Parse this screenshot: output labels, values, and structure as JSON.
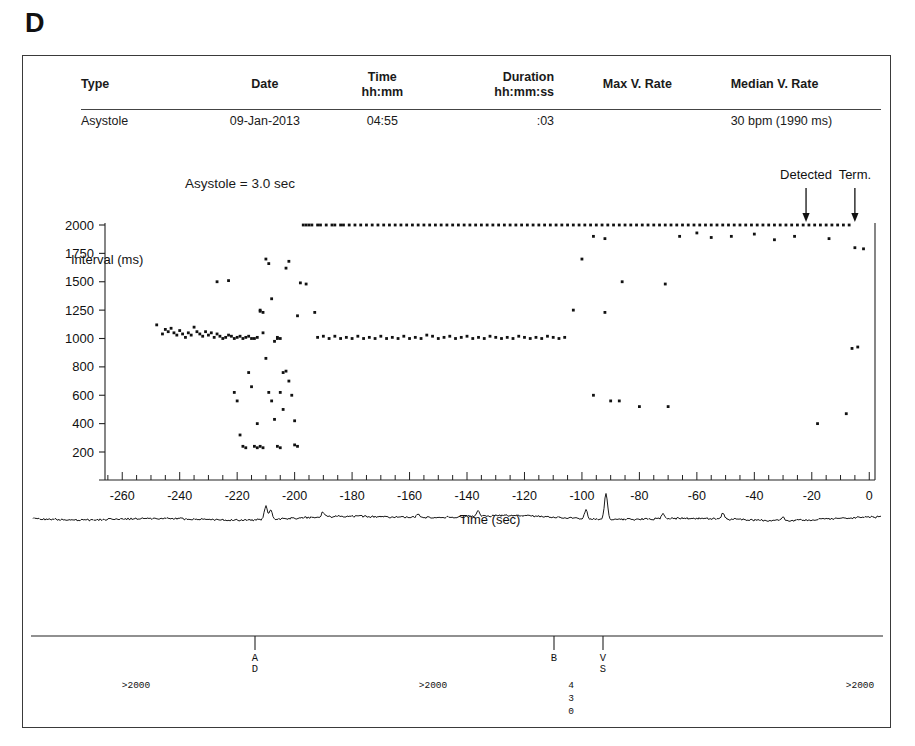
{
  "panel": {
    "letter": "D"
  },
  "summary": {
    "headers": [
      {
        "key": "type",
        "label": "Type"
      },
      {
        "key": "date",
        "label": "Date"
      },
      {
        "key": "time",
        "label": "Time\nhh:mm"
      },
      {
        "key": "dur",
        "label": "Duration\nhh:mm:ss"
      },
      {
        "key": "maxv",
        "label": "Max V. Rate"
      },
      {
        "key": "medv",
        "label": "Median V. Rate"
      }
    ],
    "row": {
      "type": "Asystole",
      "date": "09-Jan-2013",
      "time": "04:55",
      "dur": ":03",
      "maxv": "",
      "medv": "30 bpm (1990 ms)"
    }
  },
  "annotation": {
    "asystole_duration": "Asystole = 3.0 sec"
  },
  "chart_data": {
    "type": "scatter",
    "title": "",
    "xlabel": "Time (sec)",
    "ylabel": "Interval (ms)",
    "xlim": [
      -266,
      2
    ],
    "xticks": [
      -260,
      -240,
      -220,
      -200,
      -180,
      -160,
      -140,
      -120,
      -100,
      -80,
      -60,
      -40,
      -20,
      0
    ],
    "xtick_labels": [
      "-260",
      "-240",
      "-220",
      "-200",
      "-180",
      "-160",
      "-140",
      "-120",
      "-100",
      "-80",
      "-60",
      "-40",
      "-20",
      "0"
    ],
    "x_minor_tick_step": 5,
    "yticks": [
      2000,
      1750,
      1500,
      1250,
      1000,
      800,
      600,
      400,
      200
    ],
    "ytick_labels": [
      "2000",
      "1750",
      "1500",
      "1250",
      "1000",
      "800",
      "600",
      "400",
      "200"
    ],
    "y_scale": "nonlinear-even-spaced",
    "grid": false,
    "legend": false,
    "markers": [
      {
        "name": "Detected",
        "x": -22
      },
      {
        "name": "Term.",
        "x": -5
      }
    ],
    "points": [
      [
        -248,
        1120
      ],
      [
        -246,
        1040
      ],
      [
        -245,
        1080
      ],
      [
        -244,
        1060
      ],
      [
        -243,
        1090
      ],
      [
        -242,
        1050
      ],
      [
        -241,
        1030
      ],
      [
        -240,
        1070
      ],
      [
        -239,
        1040
      ],
      [
        -238,
        1010
      ],
      [
        -237,
        1050
      ],
      [
        -236,
        1030
      ],
      [
        -235,
        1100
      ],
      [
        -234,
        1060
      ],
      [
        -233,
        1040
      ],
      [
        -232,
        1020
      ],
      [
        -231,
        1060
      ],
      [
        -230,
        1030
      ],
      [
        -229,
        1050
      ],
      [
        -228,
        1010
      ],
      [
        -227,
        1040
      ],
      [
        -226,
        1020
      ],
      [
        -225,
        1000
      ],
      [
        -224,
        1010
      ],
      [
        -223,
        1030
      ],
      [
        -222,
        1020
      ],
      [
        -221,
        1000
      ],
      [
        -220,
        1010
      ],
      [
        -219,
        1020
      ],
      [
        -218,
        1000
      ],
      [
        -217,
        1010
      ],
      [
        -216,
        1020
      ],
      [
        -215,
        1000
      ],
      [
        -214,
        1000
      ],
      [
        -213,
        1010
      ],
      [
        -227,
        1500
      ],
      [
        -223,
        1510
      ],
      [
        -221,
        620
      ],
      [
        -220,
        560
      ],
      [
        -219,
        320
      ],
      [
        -218,
        240
      ],
      [
        -217,
        230
      ],
      [
        -216,
        760
      ],
      [
        -215,
        660
      ],
      [
        -214,
        240
      ],
      [
        -213,
        230
      ],
      [
        -212,
        1250
      ],
      [
        -212,
        1240
      ],
      [
        -211,
        1230
      ],
      [
        -210,
        1700
      ],
      [
        -209,
        1660
      ],
      [
        -208,
        1350
      ],
      [
        -207,
        980
      ],
      [
        -206,
        1000
      ],
      [
        -205,
        620
      ],
      [
        -204,
        500
      ],
      [
        -203,
        1620
      ],
      [
        -202,
        1680
      ],
      [
        -211,
        1050
      ],
      [
        -210,
        860
      ],
      [
        -209,
        620
      ],
      [
        -208,
        560
      ],
      [
        -207,
        430
      ],
      [
        -206,
        240
      ],
      [
        -205,
        230
      ],
      [
        -204,
        760
      ],
      [
        -203,
        770
      ],
      [
        -202,
        700
      ],
      [
        -201,
        600
      ],
      [
        -200,
        420
      ],
      [
        -200,
        250
      ],
      [
        -199,
        240
      ],
      [
        -213,
        400
      ],
      [
        -212,
        240
      ],
      [
        -211,
        230
      ],
      [
        -206,
        1010
      ],
      [
        -205,
        1000
      ],
      [
        -199,
        1200
      ],
      [
        -198,
        1490
      ],
      [
        -197,
        2000
      ],
      [
        -196,
        2000
      ],
      [
        -195,
        2000
      ],
      [
        -194,
        2000
      ],
      [
        -192,
        2000
      ],
      [
        -191,
        2000
      ],
      [
        -189,
        2000
      ],
      [
        -187,
        2000
      ],
      [
        -186,
        2000
      ],
      [
        -184,
        2000
      ],
      [
        -183,
        2000
      ],
      [
        -181,
        2000
      ],
      [
        -179,
        2000
      ],
      [
        -177,
        2000
      ],
      [
        -175,
        2000
      ],
      [
        -173,
        2000
      ],
      [
        -171,
        2000
      ],
      [
        -169,
        2000
      ],
      [
        -167,
        2000
      ],
      [
        -165,
        2000
      ],
      [
        -163,
        2000
      ],
      [
        -161,
        2000
      ],
      [
        -159,
        2000
      ],
      [
        -157,
        2000
      ],
      [
        -155,
        2000
      ],
      [
        -153,
        2000
      ],
      [
        -151,
        2000
      ],
      [
        -149,
        2000
      ],
      [
        -147,
        2000
      ],
      [
        -145,
        2000
      ],
      [
        -143,
        2000
      ],
      [
        -141,
        2000
      ],
      [
        -139,
        2000
      ],
      [
        -137,
        2000
      ],
      [
        -135,
        2000
      ],
      [
        -133,
        2000
      ],
      [
        -131,
        2000
      ],
      [
        -129,
        2000
      ],
      [
        -127,
        2000
      ],
      [
        -125,
        2000
      ],
      [
        -123,
        2000
      ],
      [
        -121,
        2000
      ],
      [
        -119,
        2000
      ],
      [
        -117,
        2000
      ],
      [
        -115,
        2000
      ],
      [
        -113,
        2000
      ],
      [
        -111,
        2000
      ],
      [
        -109,
        2000
      ],
      [
        -107,
        2000
      ],
      [
        -105,
        2000
      ],
      [
        -103,
        2000
      ],
      [
        -101,
        2000
      ],
      [
        -99,
        2000
      ],
      [
        -97,
        2000
      ],
      [
        -95,
        2000
      ],
      [
        -93,
        2000
      ],
      [
        -91,
        2000
      ],
      [
        -89,
        2000
      ],
      [
        -87,
        2000
      ],
      [
        -85,
        2000
      ],
      [
        -83,
        2000
      ],
      [
        -81,
        2000
      ],
      [
        -79,
        2000
      ],
      [
        -77,
        2000
      ],
      [
        -75,
        2000
      ],
      [
        -73,
        2000
      ],
      [
        -71,
        2000
      ],
      [
        -69,
        2000
      ],
      [
        -67,
        2000
      ],
      [
        -65,
        2000
      ],
      [
        -63,
        2000
      ],
      [
        -61,
        2000
      ],
      [
        -59,
        2000
      ],
      [
        -57,
        2000
      ],
      [
        -55,
        2000
      ],
      [
        -53,
        2000
      ],
      [
        -51,
        2000
      ],
      [
        -49,
        2000
      ],
      [
        -47,
        2000
      ],
      [
        -45,
        2000
      ],
      [
        -43,
        2000
      ],
      [
        -41,
        2000
      ],
      [
        -39,
        2000
      ],
      [
        -37,
        2000
      ],
      [
        -35,
        2000
      ],
      [
        -33,
        2000
      ],
      [
        -31,
        2000
      ],
      [
        -29,
        2000
      ],
      [
        -27,
        2000
      ],
      [
        -25,
        2000
      ],
      [
        -23,
        2000
      ],
      [
        -21,
        2000
      ],
      [
        -19,
        2000
      ],
      [
        -17,
        2000
      ],
      [
        -15,
        2000
      ],
      [
        -13,
        2000
      ],
      [
        -11,
        2000
      ],
      [
        -9,
        2000
      ],
      [
        -7,
        2000
      ],
      [
        -96,
        1900
      ],
      [
        -92,
        1880
      ],
      [
        -66,
        1900
      ],
      [
        -60,
        1930
      ],
      [
        -55,
        1890
      ],
      [
        -48,
        1900
      ],
      [
        -40,
        1920
      ],
      [
        -33,
        1870
      ],
      [
        -26,
        1900
      ],
      [
        -14,
        1880
      ],
      [
        -5,
        1800
      ],
      [
        -2,
        1790
      ],
      [
        -192,
        1010
      ],
      [
        -190,
        1020
      ],
      [
        -188,
        1000
      ],
      [
        -186,
        1020
      ],
      [
        -184,
        1000
      ],
      [
        -182,
        1010
      ],
      [
        -180,
        1000
      ],
      [
        -178,
        1020
      ],
      [
        -176,
        1000
      ],
      [
        -174,
        1010
      ],
      [
        -172,
        1000
      ],
      [
        -170,
        1020
      ],
      [
        -168,
        1000
      ],
      [
        -166,
        1010
      ],
      [
        -164,
        1000
      ],
      [
        -162,
        1020
      ],
      [
        -160,
        1000
      ],
      [
        -158,
        1010
      ],
      [
        -156,
        1000
      ],
      [
        -154,
        1030
      ],
      [
        -152,
        1020
      ],
      [
        -150,
        1000
      ],
      [
        -148,
        1010
      ],
      [
        -146,
        1020
      ],
      [
        -144,
        1000
      ],
      [
        -142,
        1010
      ],
      [
        -140,
        1020
      ],
      [
        -138,
        1000
      ],
      [
        -136,
        1010
      ],
      [
        -134,
        1000
      ],
      [
        -132,
        1020
      ],
      [
        -130,
        1010
      ],
      [
        -128,
        1000
      ],
      [
        -126,
        1010
      ],
      [
        -124,
        1000
      ],
      [
        -122,
        1020
      ],
      [
        -120,
        1010
      ],
      [
        -118,
        1000
      ],
      [
        -116,
        1010
      ],
      [
        -114,
        1000
      ],
      [
        -112,
        1020
      ],
      [
        -110,
        1010
      ],
      [
        -108,
        1000
      ],
      [
        -106,
        1010
      ],
      [
        -193,
        1230
      ],
      [
        -196,
        1480
      ],
      [
        -100,
        1700
      ],
      [
        -103,
        1250
      ],
      [
        -92,
        1230
      ],
      [
        -86,
        1500
      ],
      [
        -71,
        1480
      ],
      [
        -96,
        600
      ],
      [
        -90,
        560
      ],
      [
        -87,
        560
      ],
      [
        -80,
        520
      ],
      [
        -70,
        520
      ],
      [
        -18,
        400
      ],
      [
        -8,
        470
      ],
      [
        -6,
        930
      ],
      [
        -4,
        940
      ]
    ]
  },
  "egm": {
    "label": "egm-waveform",
    "description": "electrogram strip"
  },
  "marker_strip": {
    "events": [
      {
        "code": "AD",
        "x_px": 232,
        "kind": "atrial-detect"
      },
      {
        "code": "B",
        "x_px": 531,
        "kind": "bradycardia"
      },
      {
        "code": "VS",
        "x_px": 580,
        "kind": "ventricular-sense"
      }
    ],
    "intervals": [
      {
        "text": ">2000",
        "x_px": 113
      },
      {
        "text": ">2000",
        "x_px": 410
      },
      {
        "text": ">2000",
        "x_px": 837
      }
    ],
    "vertical_interval": {
      "digits": "430",
      "x_px": 548
    },
    "caption": "Asystole Detected"
  }
}
